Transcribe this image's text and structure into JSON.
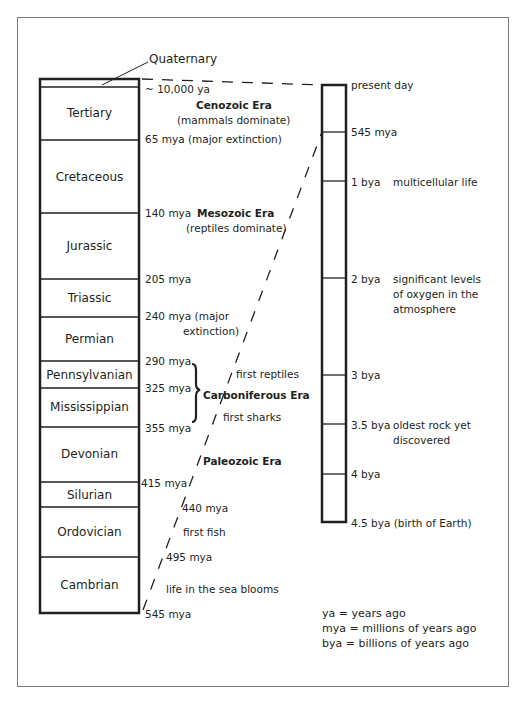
{
  "title_callout": "Quaternary",
  "left_column": {
    "periods": [
      {
        "name": "Quaternary",
        "top": 79,
        "bottom": 87
      },
      {
        "name": "Tertiary",
        "top": 87,
        "bottom": 140
      },
      {
        "name": "Cretaceous",
        "top": 140,
        "bottom": 213
      },
      {
        "name": "Jurassic",
        "top": 213,
        "bottom": 279
      },
      {
        "name": "Triassic",
        "top": 279,
        "bottom": 317
      },
      {
        "name": "Permian",
        "top": 317,
        "bottom": 361
      },
      {
        "name": "Pennsylvanian",
        "top": 361,
        "bottom": 388
      },
      {
        "name": "Mississippian",
        "top": 388,
        "bottom": 427
      },
      {
        "name": "Devonian",
        "top": 427,
        "bottom": 482
      },
      {
        "name": "Silurian",
        "top": 482,
        "bottom": 507
      },
      {
        "name": "Ordovician",
        "top": 507,
        "bottom": 557
      },
      {
        "name": "Cambrian",
        "top": 557,
        "bottom": 613
      }
    ],
    "boundary_labels": {
      "q": "~ 10,000 ya",
      "b65": "65 mya (major extinction)",
      "b140": "140 mya",
      "b205": "205 mya",
      "b240a": "240 mya (major",
      "b240b": "extinction)",
      "b290": "290 mya",
      "b325": "325 mya",
      "b355": "355 mya",
      "b415": "415 mya",
      "b440": "440 mya",
      "b495": "495 mya",
      "b545": "545 mya"
    },
    "eras": {
      "cenozoic": "Cenozoic Era",
      "cenozoic_note": "(mammals dominate)",
      "mesozoic": "Mesozoic Era",
      "mesozoic_note": "(reptiles dominate)",
      "carboniferous": "Carboniferous Era",
      "paleozoic": "Paleozoic Era"
    },
    "events": {
      "first_reptiles": "first reptiles",
      "first_sharks": "first sharks",
      "first_fish": "first fish",
      "sea_blooms": "life in the sea blooms"
    }
  },
  "right_column": {
    "ticks": [
      {
        "label": "present day",
        "y": 85,
        "note": ""
      },
      {
        "label": "545 mya",
        "y": 132,
        "note": ""
      },
      {
        "label": "1 bya",
        "y": 181,
        "note": "multicellular life"
      },
      {
        "label": "2 bya",
        "y": 278,
        "note": "significant levels\nof oxygen in the\natmosphere"
      },
      {
        "label": "3 bya",
        "y": 375,
        "note": ""
      },
      {
        "label": "3.5 bya",
        "y": 424,
        "note": "oldest rock yet\ndiscovered"
      },
      {
        "label": "4 bya",
        "y": 474,
        "note": ""
      },
      {
        "label": "4.5 bya (birth of Earth)",
        "y": 522,
        "note": ""
      }
    ],
    "labels": {
      "present": "present day",
      "m545": "545 mya",
      "b1": "1 bya",
      "b1_note": "multicellular life",
      "b2": "2 bya",
      "b2_note1": "significant levels",
      "b2_note2": "of oxygen in the",
      "b2_note3": "atmosphere",
      "b3": "3 bya",
      "b35": "3.5 bya",
      "b35_note1": "oldest rock yet",
      "b35_note2": "discovered",
      "b4": "4 bya",
      "b45": "4.5 bya (birth of Earth)"
    }
  },
  "legend": {
    "ya": "ya = years ago",
    "mya": "mya = millions of years ago",
    "bya": "bya = billions of years ago"
  },
  "colors": {
    "ink": "#231f20",
    "frame": "#7a7a7a",
    "background": "#ffffff"
  }
}
